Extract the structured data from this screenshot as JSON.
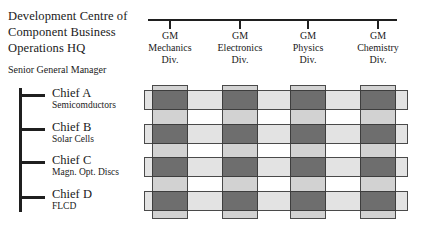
{
  "diagram": {
    "type": "matrix-organization-chart",
    "hq": {
      "lines": [
        "Development Centre of",
        "Component Business",
        "Operations HQ"
      ]
    },
    "senior_manager": {
      "label": "Senior General Manager"
    },
    "columns": [
      {
        "role": "GM",
        "division": "Mechanics",
        "division_suffix": "Div.",
        "x": 152,
        "width": 36
      },
      {
        "role": "GM",
        "division": "Electronics",
        "division_suffix": "Div.",
        "x": 222,
        "width": 36
      },
      {
        "role": "GM",
        "division": "Physics",
        "division_suffix": "Div.",
        "x": 290,
        "width": 36
      },
      {
        "role": "GM",
        "division": "Chemistry",
        "division_suffix": "Div.",
        "x": 360,
        "width": 36
      }
    ],
    "rows": [
      {
        "name": "Chief A",
        "unit": "Semicomductors",
        "y": 90,
        "height": 20,
        "label_y": 86,
        "arm_y": 94
      },
      {
        "name": "Chief B",
        "unit": "Solar Cells",
        "y": 124,
        "height": 20,
        "label_y": 120,
        "arm_y": 128
      },
      {
        "name": "Chief C",
        "unit": "Magn. Opt. Discs",
        "y": 157,
        "height": 20,
        "label_y": 153,
        "arm_y": 161
      },
      {
        "name": "Chief D",
        "unit": "FLCD",
        "y": 191,
        "height": 20,
        "label_y": 187,
        "arm_y": 196
      }
    ],
    "row_bar_extent": {
      "x": 144,
      "width": 264
    },
    "column_bar_extent": {
      "y": 85,
      "height": 134
    },
    "colors": {
      "line": "#1f1f1f",
      "column_bar_fill": "#d2d2d2",
      "row_bar_fill": "#e3e3e3",
      "intersection_fill": "#6e6e6e",
      "bar_border": "#4a4a4a",
      "text": "#1a1a1a",
      "background": "#ffffff"
    }
  }
}
